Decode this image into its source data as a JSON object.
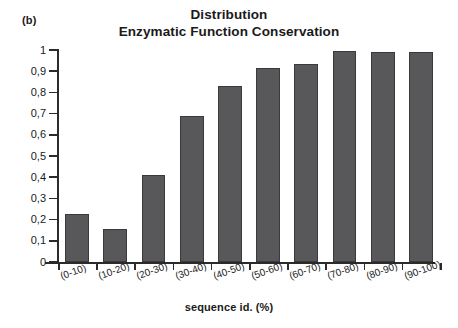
{
  "panel_tag": "(b)",
  "title_lines": [
    "Distribution",
    "Enzymatic Function Conservation"
  ],
  "colors": {
    "bar_fill": "#58585a",
    "bar_edge": "#3a3a3c",
    "axis": "#2b2b2b",
    "text": "#1a1a1a",
    "background": "#ffffff"
  },
  "chart_data": {
    "type": "bar",
    "title": "Distribution Enzymatic Function Conservation",
    "subtitle": "",
    "xlabel": "sequence id. (%)",
    "ylabel": "",
    "categories": [
      "(0-10)",
      "(10-20)",
      "(20-30)",
      "(30-40)",
      "(40-50)",
      "(50-60)",
      "(60-70)",
      "(70-80)",
      "(80-90)",
      "(90-100)"
    ],
    "values": [
      0.225,
      0.155,
      0.41,
      0.69,
      0.83,
      0.915,
      0.935,
      0.995,
      0.99,
      0.99
    ],
    "ylim": [
      0,
      1
    ],
    "ytick_values": [
      0,
      0.1,
      0.2,
      0.3,
      0.4,
      0.5,
      0.6,
      0.7,
      0.8,
      0.9,
      1
    ],
    "ytick_labels": [
      "0",
      "0,1",
      "0,2",
      "0,3",
      "0,4",
      "0,5",
      "0,6",
      "0,7",
      "0,8",
      "0,9",
      "1"
    ],
    "grid": false,
    "legend": null,
    "legend_position": "none",
    "xtick_label_rotation_deg": -20
  }
}
